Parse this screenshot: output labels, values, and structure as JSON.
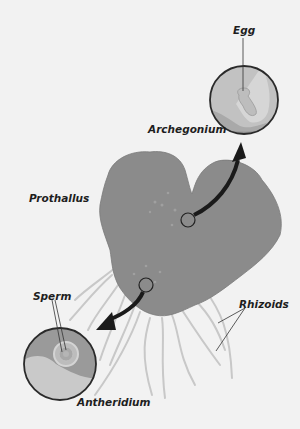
{
  "diagram": {
    "type": "fern-gametophyte",
    "labels": {
      "egg": "Egg",
      "archegonium": "Archegonium",
      "prothallus": "Prothallus",
      "sperm": "Sperm",
      "rhizoids": "Rhizoids",
      "antheridium": "Antheridium"
    },
    "colors": {
      "background": "#f2f2f2",
      "prothallus": "#8a8a8a",
      "circle_light": "#c4c4c4",
      "circle_mid": "#a9a9a9",
      "circle_dark": "#8f8f8f",
      "outline": "#2a2a2a",
      "rhizoid": "#c9c9c9",
      "arrow": "#1a1a1a"
    }
  }
}
